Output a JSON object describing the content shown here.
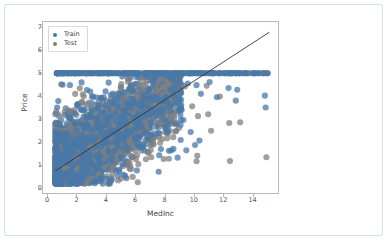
{
  "card": {
    "background": "#ffffff",
    "border_color": "#cfe2e6"
  },
  "chart_data": {
    "type": "scatter",
    "title": "",
    "xlabel": "MedInc",
    "ylabel": "Price",
    "xlim": [
      -0.35,
      15.8
    ],
    "ylim": [
      -0.25,
      7.25
    ],
    "xticks": [
      0,
      2,
      4,
      6,
      8,
      10,
      12,
      14
    ],
    "yticks": [
      0,
      1,
      2,
      3,
      4,
      5,
      6,
      7
    ],
    "xtick_labels": [
      "0",
      "2",
      "4",
      "6",
      "8",
      "10",
      "12",
      "14"
    ],
    "ytick_labels": [
      "0",
      "1",
      "2",
      "3",
      "4",
      "5",
      "6",
      "7"
    ],
    "grid": false,
    "legend_position": "upper left",
    "legend_entries": [
      {
        "label": "Train",
        "color": "#4878a8",
        "marker": "circle"
      },
      {
        "label": "Test",
        "color": "#808080",
        "marker": "circle"
      }
    ],
    "annotations": [
      {
        "kind": "line",
        "label": "diagonal-reference-line",
        "color": "#333333",
        "x0": 0.5,
        "y0": 0.72,
        "x1": 15.2,
        "y1": 6.8
      },
      {
        "kind": "band",
        "label": "price-cap-at-5",
        "y": 5.0,
        "x_from": 0.5,
        "x_to": 15.2,
        "note": "capped target values"
      }
    ],
    "series": [
      {
        "name": "Train",
        "color": "#4878a8",
        "marker_size": 3.1,
        "opacity": 0.75,
        "cloud": {
          "n": 1650,
          "x_range": [
            0.5,
            9.2
          ],
          "y_range": [
            0.15,
            5.0
          ],
          "slope": 0.42,
          "intercept": 0.5,
          "spread": 0.95,
          "seed": 17
        },
        "cap_band": {
          "n": 170,
          "y": 5.0,
          "x_range": [
            0.6,
            15.1
          ],
          "seed": 71
        },
        "outliers": [
          [
            9.6,
            4.55
          ],
          [
            10.2,
            4.48
          ],
          [
            10.5,
            4.1
          ],
          [
            11.1,
            4.62
          ],
          [
            11.6,
            3.95
          ],
          [
            12.4,
            4.35
          ],
          [
            13.0,
            4.28
          ],
          [
            12.9,
            3.8
          ],
          [
            14.9,
            4.02
          ],
          [
            14.95,
            3.5
          ],
          [
            9.8,
            2.42
          ],
          [
            10.4,
            2.05
          ],
          [
            10.1,
            1.85
          ],
          [
            9.5,
            1.62
          ],
          [
            8.9,
            1.3
          ],
          [
            7.6,
            0.68
          ],
          [
            6.1,
            0.74
          ],
          [
            5.3,
            0.5
          ],
          [
            4.2,
            0.18
          ],
          [
            3.0,
            0.2
          ],
          [
            1.0,
            4.5
          ],
          [
            0.7,
            3.78
          ],
          [
            0.62,
            3.5
          ],
          [
            0.55,
            2.78
          ],
          [
            0.8,
            2.72
          ],
          [
            1.5,
            4.48
          ],
          [
            2.3,
            4.6
          ],
          [
            2.9,
            4.2
          ],
          [
            9.1,
            3.4
          ],
          [
            9.3,
            2.95
          ]
        ]
      },
      {
        "name": "Test",
        "color": "#808080",
        "marker_size": 3.1,
        "opacity": 0.75,
        "cloud": {
          "n": 1350,
          "x_range": [
            0.5,
            9.0
          ],
          "y_range": [
            0.15,
            5.0
          ],
          "slope": 0.42,
          "intercept": 0.5,
          "spread": 0.95,
          "seed": 43
        },
        "cap_band": {
          "n": 150,
          "y": 5.0,
          "x_range": [
            0.6,
            15.1
          ],
          "seed": 99
        },
        "outliers": [
          [
            10.3,
            3.12
          ],
          [
            11.2,
            2.48
          ],
          [
            10.25,
            1.38
          ],
          [
            10.2,
            1.14
          ],
          [
            12.5,
            1.15
          ],
          [
            15.0,
            1.32
          ],
          [
            12.45,
            2.82
          ],
          [
            11.8,
            3.98
          ],
          [
            9.9,
            3.55
          ],
          [
            9.4,
            4.42
          ],
          [
            10.9,
            4.45
          ],
          [
            8.6,
            2.2
          ],
          [
            7.7,
            1.95
          ],
          [
            6.9,
            1.5
          ],
          [
            5.6,
            1.1
          ],
          [
            4.25,
            0.16
          ],
          [
            2.5,
            0.2
          ],
          [
            1.2,
            0.18
          ],
          [
            0.9,
            4.52
          ],
          [
            0.68,
            3.2
          ],
          [
            0.6,
            2.75
          ],
          [
            8.3,
            1.25
          ],
          [
            9.0,
            2.6
          ],
          [
            13.2,
            2.85
          ],
          [
            11.0,
            3.2
          ]
        ]
      }
    ]
  }
}
